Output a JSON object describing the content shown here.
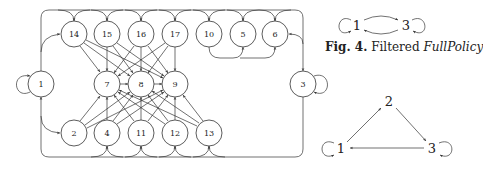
{
  "figure_caption": {
    "label": "Fig. 4.",
    "text": "Filtered",
    "emphasis": "FullPolicy"
  },
  "main_graph": {
    "nodes": [
      {
        "id": "1",
        "x": 41,
        "y": 84
      },
      {
        "id": "14",
        "x": 74,
        "y": 34
      },
      {
        "id": "15",
        "x": 107,
        "y": 34
      },
      {
        "id": "16",
        "x": 141,
        "y": 34
      },
      {
        "id": "17",
        "x": 175,
        "y": 34
      },
      {
        "id": "10",
        "x": 209,
        "y": 34
      },
      {
        "id": "5",
        "x": 243,
        "y": 34
      },
      {
        "id": "6",
        "x": 275,
        "y": 34
      },
      {
        "id": "7",
        "x": 107,
        "y": 84
      },
      {
        "id": "8",
        "x": 141,
        "y": 84
      },
      {
        "id": "9",
        "x": 175,
        "y": 84
      },
      {
        "id": "3",
        "x": 303,
        "y": 84
      },
      {
        "id": "2",
        "x": 74,
        "y": 133
      },
      {
        "id": "4",
        "x": 107,
        "y": 133
      },
      {
        "id": "11",
        "x": 141,
        "y": 133
      },
      {
        "id": "12",
        "x": 175,
        "y": 133
      },
      {
        "id": "13",
        "x": 209,
        "y": 133
      }
    ],
    "self_loops": [
      "1",
      "3"
    ],
    "top_row_to_middle": [
      "14",
      "15",
      "16",
      "17"
    ],
    "bottom_row_to_middle": [
      "2",
      "4",
      "11",
      "12",
      "13"
    ],
    "middle_targets": [
      "7",
      "8",
      "9"
    ]
  },
  "small_graph_a": {
    "nodes": [
      {
        "id": "1",
        "x": 357,
        "y": 25
      },
      {
        "id": "3",
        "x": 406,
        "y": 25
      }
    ],
    "edges": [
      [
        "1",
        "3"
      ],
      [
        "3",
        "1"
      ]
    ],
    "self_loops": [
      "1",
      "3"
    ]
  },
  "small_graph_b": {
    "nodes": [
      {
        "id": "2",
        "x": 389,
        "y": 101
      },
      {
        "id": "1",
        "x": 341,
        "y": 148
      },
      {
        "id": "3",
        "x": 432,
        "y": 148
      }
    ],
    "edges": [
      [
        "1",
        "2"
      ],
      [
        "2",
        "3"
      ],
      [
        "3",
        "1"
      ]
    ],
    "self_loops": [
      "1",
      "3"
    ]
  }
}
